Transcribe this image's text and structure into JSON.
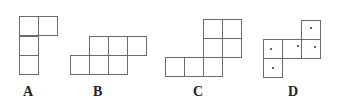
{
  "figures": [
    {
      "label": "A",
      "label_pos": [
        23,
        84
      ],
      "cells": [
        [
          19,
          16
        ],
        [
          38,
          16
        ],
        [
          19,
          36
        ],
        [
          19,
          55
        ]
      ],
      "marks": []
    },
    {
      "label": "B",
      "label_pos": [
        93,
        84
      ],
      "cells": [
        [
          89,
          36
        ],
        [
          108,
          36
        ],
        [
          127,
          36
        ],
        [
          70,
          55
        ],
        [
          89,
          55
        ],
        [
          108,
          55
        ]
      ],
      "marks": []
    },
    {
      "label": "C",
      "label_pos": [
        193,
        84
      ],
      "cells": [
        [
          203,
          19
        ],
        [
          222,
          19
        ],
        [
          203,
          38
        ],
        [
          222,
          38
        ],
        [
          165,
          57
        ],
        [
          184,
          57
        ],
        [
          203,
          57
        ]
      ],
      "marks": []
    },
    {
      "label": "D",
      "label_pos": [
        288,
        84
      ],
      "cells": [
        [
          301,
          20
        ],
        [
          263,
          39
        ],
        [
          282,
          39
        ],
        [
          301,
          39
        ],
        [
          263,
          58
        ]
      ],
      "marks": [
        [
          310,
          27
        ],
        [
          270,
          48
        ],
        [
          297,
          45
        ],
        [
          314,
          46
        ],
        [
          272,
          67
        ]
      ]
    }
  ],
  "colors": {
    "line": "#6a6a6a",
    "label": "#222222"
  }
}
